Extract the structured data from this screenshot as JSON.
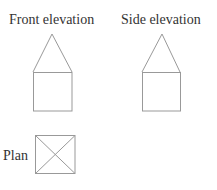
{
  "diagram": {
    "views": [
      {
        "id": "front",
        "label": "Front elevation",
        "shape": "house-profile"
      },
      {
        "id": "side",
        "label": "Side elevation",
        "shape": "house-profile"
      },
      {
        "id": "plan",
        "label": "Plan",
        "shape": "square-with-diagonals"
      }
    ],
    "colors": {
      "text": "#333333",
      "line": "#999999",
      "background": "#ffffff"
    }
  }
}
